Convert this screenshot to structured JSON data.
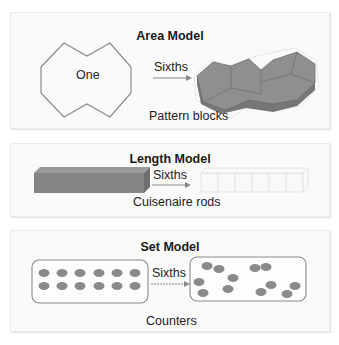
{
  "colors": {
    "block_fill": "#8c8c8c",
    "block_edge": "#6e6e6e",
    "outline": "#7a7a7a",
    "panel_bg": "#fafafa",
    "arrow": "#888888",
    "counter": "#888888"
  },
  "panels": [
    {
      "title": "Area Model",
      "whole_label": "One",
      "arrow_label": "Sixths",
      "caption": "Pattern blocks",
      "whole_icon": "double-hexagon-outline",
      "parts_icon": "pattern-block-rhombuses"
    },
    {
      "title": "Length Model",
      "arrow_label": "Sixths",
      "caption": "Cuisenaire rods",
      "whole_icon": "long-rod",
      "parts_icon": "six-small-cubes"
    },
    {
      "title": "Set Model",
      "arrow_label": "Sixths",
      "caption": "Counters",
      "whole_counters": 12,
      "parts_counters": 12,
      "whole_icon": "counter-grid-box",
      "parts_icon": "scattered-counters-box"
    }
  ]
}
